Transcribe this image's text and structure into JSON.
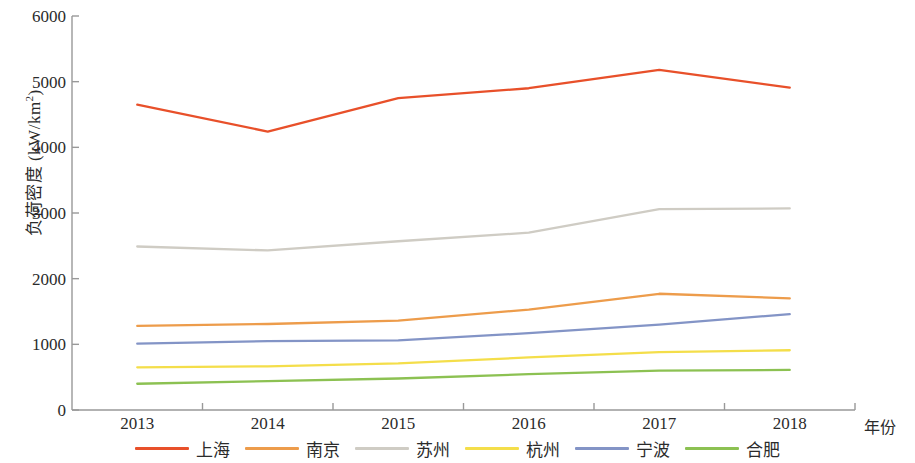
{
  "chart_data": {
    "type": "line",
    "title": "",
    "xlabel": "年份",
    "ylabel": "负荷密度 (kW/km²)",
    "ylabel_main": "负荷密度 (kW/km",
    "ylabel_sup": "2",
    "ylabel_tail": ")",
    "x": [
      2013,
      2014,
      2015,
      2016,
      2017,
      2018
    ],
    "categories": [
      "2013",
      "2014",
      "2015",
      "2016",
      "2017",
      "2018"
    ],
    "xlim": [
      2012.5,
      2018.6
    ],
    "ylim": [
      0,
      6000
    ],
    "yticks": [
      0,
      1000,
      2000,
      3000,
      4000,
      5000,
      6000
    ],
    "ytick_labels": [
      "0",
      "1000",
      "2000",
      "3000",
      "4000",
      "5000",
      "6000"
    ],
    "grid": false,
    "legend_position": "bottom",
    "series": [
      {
        "name": "上海",
        "color": "#E8502A",
        "values": [
          4650,
          4240,
          4750,
          4900,
          5180,
          4910
        ]
      },
      {
        "name": "南京",
        "color": "#ED9C4B",
        "values": [
          1280,
          1310,
          1360,
          1530,
          1770,
          1700
        ]
      },
      {
        "name": "苏州",
        "color": "#CFCCC4",
        "values": [
          2490,
          2430,
          2570,
          2700,
          3060,
          3070
        ]
      },
      {
        "name": "杭州",
        "color": "#F4DE4A",
        "values": [
          650,
          665,
          710,
          800,
          880,
          910
        ]
      },
      {
        "name": "宁波",
        "color": "#8394C6",
        "values": [
          1010,
          1050,
          1060,
          1170,
          1300,
          1460
        ]
      },
      {
        "name": "合肥",
        "color": "#8CC152",
        "values": [
          400,
          440,
          480,
          545,
          600,
          610
        ]
      }
    ]
  },
  "axis": {
    "color": "#999999"
  }
}
